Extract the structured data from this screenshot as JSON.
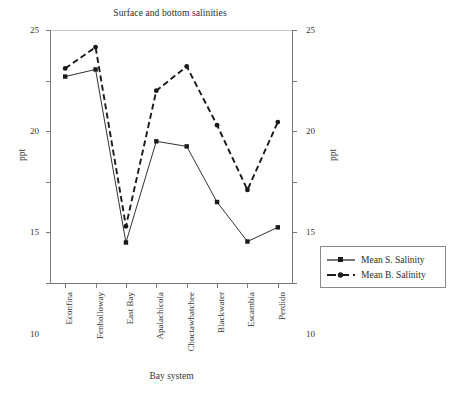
{
  "chart_data": {
    "type": "line",
    "title": "Surface and bottom salinities",
    "xlabel": "Bay system",
    "ylabel": "ppt",
    "ylabel_right": "ppt",
    "categories": [
      "Econfina",
      "Fenholloway",
      "East Bay",
      "Apalachicola",
      "Choctawhatchee",
      "Blackwater",
      "Escambia",
      "Perdido"
    ],
    "yticks": [
      0,
      5,
      10,
      15,
      20,
      25
    ],
    "yticks_right": [
      0,
      5,
      10,
      15,
      20,
      25
    ],
    "ylim": [
      0,
      25
    ],
    "grid": false,
    "legend_position": "right-outside",
    "series": [
      {
        "name": "Mean S. Salinity",
        "values": [
          20.4,
          21.1,
          4.0,
          14.0,
          13.5,
          8.0,
          4.1,
          5.5
        ],
        "line_style": "solid",
        "marker": "square",
        "color": "#1a1a1a"
      },
      {
        "name": "Mean B. Salinity",
        "values": [
          21.2,
          23.3,
          5.6,
          19.0,
          21.4,
          15.6,
          9.2,
          15.9
        ],
        "line_style": "dashed",
        "marker": "circle",
        "color": "#1a1a1a"
      }
    ]
  },
  "legend": {
    "items": [
      {
        "label": "Mean S. Salinity"
      },
      {
        "label": "Mean B. Salinity"
      }
    ]
  }
}
